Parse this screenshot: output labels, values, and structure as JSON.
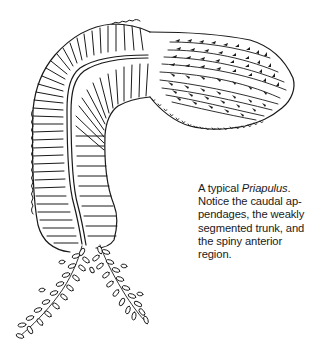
{
  "figure": {
    "subject": "Priapulus",
    "caption": {
      "lines": [
        {
          "pre": "A typical ",
          "italic": "Priapulus",
          "post": "."
        },
        {
          "text": "Notice the caudal ap-"
        },
        {
          "text": "pendages, the weakly"
        },
        {
          "text": "segmented trunk, and"
        },
        {
          "text": "the spiny anterior"
        },
        {
          "text": "region."
        }
      ]
    },
    "colors": {
      "ink": "#1a1a1a",
      "background": "#ffffff"
    }
  }
}
